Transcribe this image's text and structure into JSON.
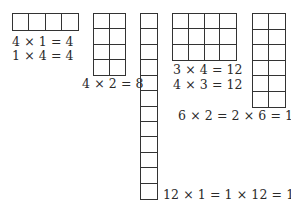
{
  "figure": {
    "title": "",
    "arrays": [
      {
        "id": "4x1",
        "rows": 1,
        "cols": 4,
        "equations": [
          "4 × 1 = 4",
          "1 × 4 = 4"
        ]
      },
      {
        "id": "4x2",
        "rows": 4,
        "cols": 2,
        "equations": [
          "4 × 2 = 8"
        ]
      },
      {
        "id": "12x1",
        "rows": 12,
        "cols": 1,
        "equations": [
          "12 × 1 = 1 × 12 = 12"
        ]
      },
      {
        "id": "3x4",
        "rows": 3,
        "cols": 4,
        "equations": [
          "3 × 4 = 12",
          "4 × 3 = 12"
        ]
      },
      {
        "id": "6x2",
        "rows": 6,
        "cols": 2,
        "equations": [
          "6 × 2 = 2 × 6 = 12"
        ]
      }
    ]
  },
  "colors": {
    "line": "#333333",
    "text": "#2a2a2a",
    "background": "#ffffff"
  }
}
